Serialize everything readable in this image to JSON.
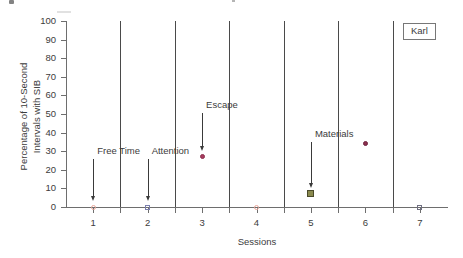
{
  "subject": {
    "label": "Karl"
  },
  "chart_data": {
    "type": "scatter",
    "title": "",
    "xlabel": "Sessions",
    "ylabel": "Percentage of 10-Second Intervals with SIB",
    "ylabel_line1": "Percentage of 10-Second",
    "ylabel_line2": "Intervals with SIB",
    "xlim": [
      0.5,
      7.5
    ],
    "ylim": [
      0,
      100
    ],
    "yticks": [
      0,
      10,
      20,
      30,
      40,
      50,
      60,
      70,
      80,
      90,
      100
    ],
    "ytick_labels": [
      "0",
      "10",
      "20",
      "30",
      "40",
      "50",
      "60",
      "70",
      "80",
      "90",
      "100"
    ],
    "xticks": [
      1,
      2,
      3,
      4,
      5,
      6,
      7
    ],
    "xtick_labels": [
      "1",
      "2",
      "3",
      "4",
      "5",
      "6",
      "7"
    ],
    "grid": false,
    "legend_position": "none",
    "x": [
      1,
      2,
      3,
      4,
      5,
      6,
      7
    ],
    "values": [
      0,
      0,
      27,
      0,
      7,
      34,
      0
    ],
    "points": [
      {
        "session": 1,
        "value": 0,
        "condition": "Free Time",
        "marker": "circle",
        "fill": "none",
        "edge": "#e8a79b",
        "size": 5
      },
      {
        "session": 2,
        "value": 0,
        "condition": "Attention",
        "marker": "square",
        "fill": "none",
        "edge": "#7b7fae",
        "size": 5
      },
      {
        "session": 3,
        "value": 27,
        "condition": "Escape",
        "marker": "circle",
        "fill": "#a83a5e",
        "edge": "#8c2f4d",
        "size": 5
      },
      {
        "session": 4,
        "value": 0,
        "condition": "Free Time",
        "marker": "circle",
        "fill": "none",
        "edge": "#e8a79b",
        "size": 5
      },
      {
        "session": 5,
        "value": 7,
        "condition": "Materials",
        "marker": "square",
        "fill": "#8a8a4e",
        "edge": "#4a4a2a",
        "size": 7
      },
      {
        "session": 6,
        "value": 34,
        "condition": "Escape",
        "marker": "circle",
        "fill": "#8c2f4d",
        "edge": "#6f2340",
        "size": 5
      },
      {
        "session": 7,
        "value": 0,
        "condition": "Attention",
        "marker": "square",
        "fill": "none",
        "edge": "#6e6e80",
        "size": 5
      }
    ],
    "phase_dividers": [
      1.5,
      2.5,
      3.5,
      4.5,
      5.5,
      6.5
    ],
    "annotations": [
      {
        "text": "Free Time",
        "target_session": 1,
        "target_value": 0,
        "label_value": 30
      },
      {
        "text": "Attention",
        "target_session": 2,
        "target_value": 0,
        "label_value": 30
      },
      {
        "text": "Escape",
        "target_session": 3,
        "target_value": 27,
        "label_value": 55
      },
      {
        "text": "Materials",
        "target_session": 5,
        "target_value": 7,
        "label_value": 39
      }
    ]
  }
}
